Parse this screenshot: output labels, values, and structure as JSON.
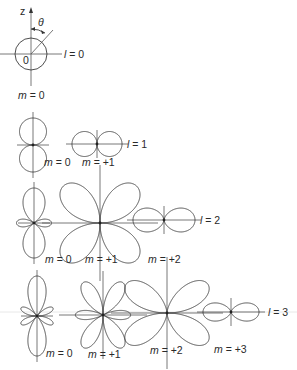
{
  "figure": {
    "axis_label": "z",
    "angle_label": "θ",
    "origin_label": "0",
    "colors": {
      "stroke": "#3a3a3a",
      "axis": "#555555",
      "text": "#2a2a2a",
      "background": "#ffffff"
    }
  },
  "rows": [
    {
      "l_label": "l = 0",
      "plots": [
        {
          "l": 0,
          "m": 0,
          "m_label": "m = 0",
          "cx": 31,
          "cy": 54,
          "scale": 16
        }
      ]
    },
    {
      "l_label": "l = 1",
      "plots": [
        {
          "l": 1,
          "m": 0,
          "m_label": "m = 0",
          "cx": 33,
          "cy": 145,
          "scale": 27
        },
        {
          "l": 1,
          "m": 1,
          "m_label": "m = +1",
          "cx": 97,
          "cy": 144,
          "scale": 25
        }
      ]
    },
    {
      "l_label": "l = 2",
      "plots": [
        {
          "l": 2,
          "m": 0,
          "m_label": "m = 0",
          "cx": 34,
          "cy": 223,
          "scale": 35
        },
        {
          "l": 2,
          "m": 1,
          "m_label": "m = +1",
          "cx": 100,
          "cy": 223,
          "scale": 52
        },
        {
          "l": 2,
          "m": 2,
          "m_label": "m = +2",
          "cx": 164,
          "cy": 220,
          "scale": 31
        }
      ]
    },
    {
      "l_label": "l = 3",
      "plots": [
        {
          "l": 3,
          "m": 0,
          "m_label": "m = 0",
          "cx": 37,
          "cy": 316,
          "scale": 40
        },
        {
          "l": 3,
          "m": 1,
          "m_label": "m = +1",
          "cx": 103,
          "cy": 315,
          "scale": 38
        },
        {
          "l": 3,
          "m": 2,
          "m_label": "m = +2",
          "cx": 167,
          "cy": 313,
          "scale": 50
        },
        {
          "l": 3,
          "m": 3,
          "m_label": "m = +3",
          "cx": 231,
          "cy": 312,
          "scale": 28
        }
      ]
    }
  ],
  "labels": {
    "l0": {
      "text": "l = 0",
      "x": 64,
      "y": 58
    },
    "l1": {
      "text": "l = 1",
      "x": 127,
      "y": 148
    },
    "l2": {
      "text": "l = 2",
      "x": 200,
      "y": 224
    },
    "l3": {
      "text": "l = 3",
      "x": 268,
      "y": 316
    },
    "m_l0_0": {
      "text": "m = 0",
      "x": 18,
      "y": 99
    },
    "m_l1_0": {
      "text": "m = 0",
      "x": 44,
      "y": 166
    },
    "m_l1_1": {
      "text": "m = +1",
      "x": 82,
      "y": 166
    },
    "m_l2_0": {
      "text": "m = 0",
      "x": 45,
      "y": 263
    },
    "m_l2_1": {
      "text": "m = +1",
      "x": 85,
      "y": 263
    },
    "m_l2_2": {
      "text": "m = +2",
      "x": 148,
      "y": 263
    },
    "m_l3_0": {
      "text": "m = 0",
      "x": 46,
      "y": 357
    },
    "m_l3_1": {
      "text": "m = +1",
      "x": 88,
      "y": 358
    },
    "m_l3_2": {
      "text": "m = +2",
      "x": 150,
      "y": 354
    },
    "m_l3_3": {
      "text": "m = +3",
      "x": 214,
      "y": 353
    }
  }
}
